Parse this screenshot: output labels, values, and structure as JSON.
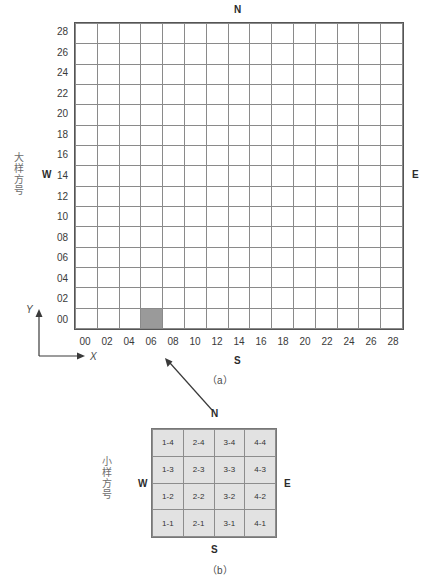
{
  "figure": {
    "panels": [
      {
        "id": "a",
        "caption": "（a）",
        "axis_label_cn": "大样方号",
        "compass": {
          "north": "N",
          "south": "S",
          "east": "E",
          "west": "W"
        },
        "x_axis_arrow_label": "X",
        "y_axis_arrow_label": "Y",
        "x_ticks": [
          "00",
          "02",
          "04",
          "06",
          "08",
          "10",
          "12",
          "14",
          "16",
          "18",
          "20",
          "22",
          "24",
          "26",
          "28"
        ],
        "y_ticks": [
          "28",
          "26",
          "24",
          "22",
          "20",
          "18",
          "16",
          "14",
          "12",
          "10",
          "08",
          "06",
          "04",
          "02",
          "00"
        ],
        "annotation": {
          "line1": "eg:",
          "line2": "1804",
          "cell_col": 9,
          "cell_row": 12
        },
        "highlight_cell": {
          "col": 3,
          "row": 14,
          "color": "#9a9a9a"
        },
        "grid_cols": 15,
        "grid_rows": 15
      },
      {
        "id": "b",
        "caption": "（b）",
        "axis_label_cn": "小样方号",
        "compass": {
          "north": "N",
          "south": "S",
          "east": "E",
          "west": "W"
        },
        "grid_cols": 4,
        "grid_rows": 4,
        "cells": [
          [
            "1-4",
            "2-4",
            "3-4",
            "4-4"
          ],
          [
            "1-3",
            "2-3",
            "3-3",
            "4-3"
          ],
          [
            "1-2",
            "2-2",
            "3-2",
            "4-2"
          ],
          [
            "1-1",
            "2-1",
            "3-1",
            "4-1"
          ]
        ],
        "cell_fill": "#e2e2e2"
      }
    ]
  },
  "chart_data": {
    "type": "table",
    "title": "",
    "panel_a": {
      "type": "heatmap",
      "description": "15x15 quadrat grid with one highlighted cell",
      "xlabel": "X",
      "ylabel": "Y",
      "x_ticks": [
        "00",
        "02",
        "04",
        "06",
        "08",
        "10",
        "12",
        "14",
        "16",
        "18",
        "20",
        "22",
        "24",
        "26",
        "28"
      ],
      "y_ticks": [
        "00",
        "02",
        "04",
        "06",
        "08",
        "10",
        "12",
        "14",
        "16",
        "18",
        "20",
        "22",
        "24",
        "26",
        "28"
      ],
      "xlim": [
        0,
        30
      ],
      "ylim": [
        0,
        30
      ],
      "grid": true,
      "highlighted": [
        {
          "x": "06",
          "y": "00",
          "color": "#9a9a9a"
        }
      ],
      "annotations": [
        {
          "text": "eg: 1804",
          "x": "18",
          "y": "04"
        }
      ]
    },
    "panel_b": {
      "type": "table",
      "description": "4x4 subplot numbering grid",
      "categories": [
        "1",
        "2",
        "3",
        "4"
      ],
      "rows": [
        [
          "1-4",
          "2-4",
          "3-4",
          "4-4"
        ],
        [
          "1-3",
          "2-3",
          "3-3",
          "4-3"
        ],
        [
          "1-2",
          "2-2",
          "3-2",
          "4-2"
        ],
        [
          "1-1",
          "2-1",
          "3-1",
          "4-1"
        ]
      ]
    }
  },
  "labels": {
    "a_north": "N",
    "a_south": "S",
    "a_east": "E",
    "a_west": "W",
    "a_caption": "（a）",
    "a_cn": "大样方号",
    "a_x": "X",
    "a_y": "Y",
    "b_north": "N",
    "b_south": "S",
    "b_east": "E",
    "b_west": "W",
    "b_caption": "（b）",
    "b_cn": "小样方号",
    "eg_line1": "eg:",
    "eg_line2": "1804"
  }
}
